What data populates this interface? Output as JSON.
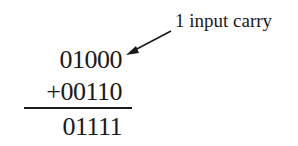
{
  "diagram": {
    "type": "binary-addition",
    "annotation": {
      "text": "1 input carry",
      "arrow": "points-to-top-operand"
    },
    "operand1": "01000",
    "operand2": "+00110",
    "result": "01111",
    "colors": {
      "ink": "#1a1a1a",
      "background": "#ffffff"
    }
  }
}
